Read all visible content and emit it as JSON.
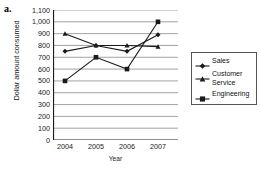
{
  "panel": {
    "letter": "a."
  },
  "chart_data": {
    "type": "line",
    "title": "",
    "xlabel": "Year",
    "ylabel": "Dollar amount consumed",
    "categories": [
      "2004",
      "2005",
      "2006",
      "2007"
    ],
    "ylim": [
      0,
      1100
    ],
    "ytick_step": 100,
    "ytick_labels": [
      "1,100",
      "1,000",
      "900",
      "800",
      "700",
      "600",
      "500",
      "400",
      "300",
      "200",
      "100",
      "0"
    ],
    "ytick_values": [
      1100,
      1000,
      900,
      800,
      700,
      600,
      500,
      400,
      300,
      200,
      100,
      0
    ],
    "grid": "horizontal",
    "legend_position": "right",
    "series": [
      {
        "name": "Sales",
        "marker": "diamond",
        "values": [
          750,
          800,
          750,
          890
        ]
      },
      {
        "name": "Customer Service",
        "marker": "triangle",
        "values": [
          900,
          800,
          800,
          790
        ]
      },
      {
        "name": "Engineering",
        "marker": "square",
        "values": [
          500,
          700,
          600,
          1000
        ]
      }
    ],
    "colors": {
      "line": "#1a1a1a",
      "grid": "#8c8c8c",
      "axis": "#1a1a1a",
      "background": "#ffffff"
    }
  },
  "legend": {
    "items": [
      {
        "label": "Sales",
        "marker": "diamond-marker"
      },
      {
        "label": "Customer Service",
        "marker": "triangle-marker"
      },
      {
        "label": "Engineering",
        "marker": "square-marker"
      }
    ]
  }
}
